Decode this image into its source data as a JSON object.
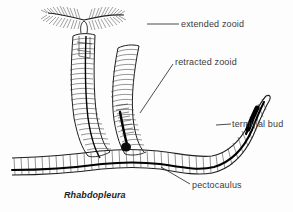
{
  "figure": {
    "organism": "Rhabdopleura",
    "caption": "Rhabdopleura",
    "labels": {
      "extended_zooid": "extended zooid",
      "retracted_zooid": "retracted zooid",
      "terminal_bud": "terminal bud",
      "pectocaulus": "pectocaulus"
    },
    "colors": {
      "ink": "#1e1e1e",
      "text": "#3b3b3b",
      "hatch": "#555555",
      "background": "#fdfdfd",
      "stolon": "#000000"
    },
    "parts": [
      {
        "name": "extended-zooid",
        "description": "zooid with expanded feathery tentacle arms emerging from annulated tube",
        "label": "extended zooid"
      },
      {
        "name": "retracted-zooid",
        "description": "zooid withdrawn inside curved annulated tube",
        "label": "retracted zooid"
      },
      {
        "name": "terminal-bud",
        "description": "dark growing bud at the tapered distal end of the creeping tube",
        "label": "terminal bud"
      },
      {
        "name": "pectocaulus",
        "description": "horizontal creeping tube containing the black stolon connecting zooids",
        "label": "pectocaulus"
      }
    ]
  }
}
